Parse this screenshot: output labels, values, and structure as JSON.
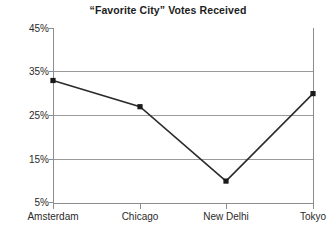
{
  "chart_data": {
    "type": "line",
    "title": "“Favorite City” Votes Received",
    "xlabel": "",
    "ylabel": "",
    "categories": [
      "Amsterdam",
      "Chicago",
      "New Delhi",
      "Tokyo"
    ],
    "values": [
      33,
      27,
      10,
      30
    ],
    "series": [
      {
        "name": "Votes Received",
        "values": [
          33,
          27,
          10,
          30
        ]
      }
    ],
    "ylim": [
      5,
      45
    ],
    "ytick_labels": [
      "45%",
      "35%",
      "25%",
      "15%",
      "5%"
    ],
    "ytick_values": [
      45,
      35,
      25,
      15,
      5
    ],
    "grid": "horizontal",
    "legend": "none",
    "marker": "filled-square",
    "line_color": "#2b2b2b",
    "marker_color": "#1a1a1a",
    "grid_color": "#9a9a9a",
    "axis_color": "#8d8d8d",
    "background": "#ffffff"
  }
}
